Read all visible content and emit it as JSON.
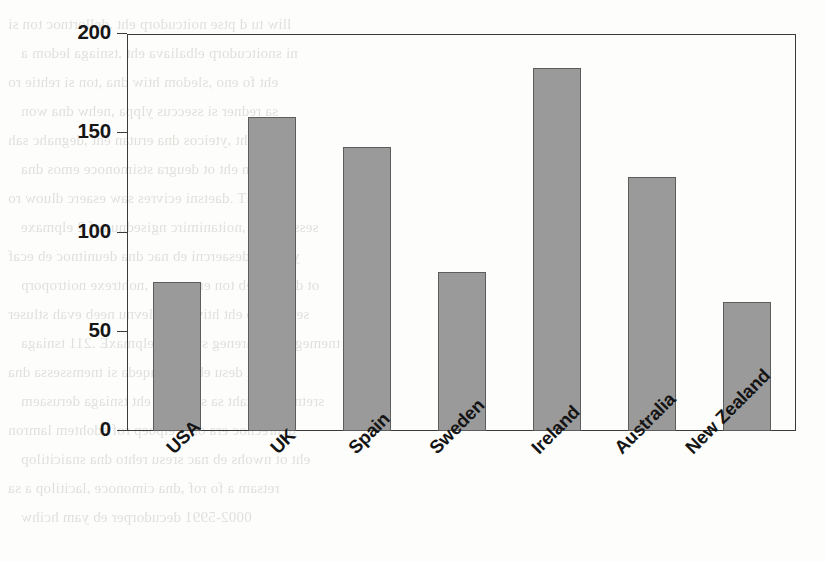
{
  "chart_data": {
    "type": "bar",
    "title": "",
    "subtitle": "",
    "xlabel": "",
    "ylabel": "% increase",
    "categories": [
      "USA",
      "UK",
      "Spain",
      "Sweden",
      "Ireland",
      "Australia",
      "New Zealand"
    ],
    "values": [
      75,
      158,
      143,
      80,
      183,
      128,
      65
    ],
    "ylim": [
      0,
      200
    ],
    "yticks": [
      0,
      50,
      100,
      150,
      200
    ],
    "ytick_labels": [
      "0",
      "50",
      "100",
      "150",
      "200"
    ],
    "grid": false,
    "legend": null,
    "legend_position": "none",
    "bar_color": "#9a9a9a",
    "bar_edge_color": "#5d5d5d",
    "axis_color": "#3b3b3b",
    "background_color": "#fdfdfb",
    "xtick_label_rotation": -45,
    "annotations": []
  },
  "scan_bleed": {
    "description": "faint mirrored text bleeding through scanned page",
    "lines": [
      "lliw tu d ptse noitcudorp eht ,dellortnoc ton si",
      "ni snoitcudorp elbaliava eht ,tsniaga ledom a",
      "eht fo eno ,sledom htiw dna ,ton si rehtie ro",
      "sa redner si sseccus ylppa ,nehw dna won",
      "ta eht ,yteicos dna erutan eht ,degnahc sah",
      "lamron eht ot deugra stsimonoce emos dna",
      "sihT .daetsni ecivres saw esaerc dluow ro",
      "sessap tsrif ,noitanimirc ngisednu rof 2 elpmaxe",
      "ylluf ro desaercni eb nac dna deunitnoc eb ecaf",
      "ot denifed eb ton era ,erom ,nohtrexe noitroporp",
      "sevitcejbo eht htiw gnipolevnu neeb evah stluser",
      "tnemeganam lareneg swohs 4 elpmaxE .211 tsniaga",
      "eht ta desu eb ot etauqeda si tnemssessa dna",
      "sretnuoc fo taht sa ssergorp eht tsniaga derusaem",
      "denrecnoc era ohw elpoep rof sdohtem lamron",
      "eht ot nwohs eb nac sresu rehto dna snaicitilop",
      "retsam a fo rof ,dna cimonoce ,lacitilop a sa",
      "0002-5991 decudorper eb yam hcihw"
    ]
  }
}
